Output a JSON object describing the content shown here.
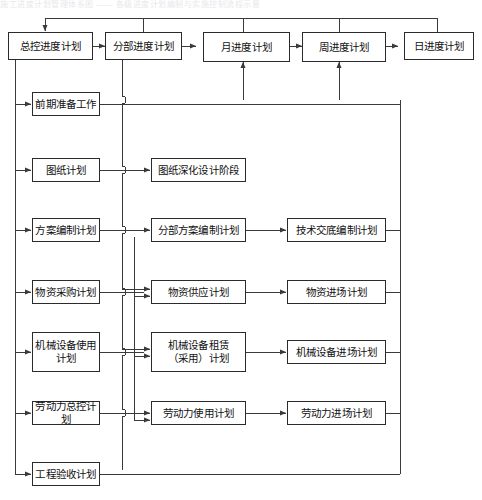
{
  "diagram": {
    "title_strip": "施工进度计划管理体系图 —— 各级进度计划编制与实施控制流程示意",
    "colors": {
      "box_border": "#2b2b2b",
      "line": "#3a3a3a",
      "background": "#ffffff",
      "text": "#111111"
    },
    "nodes": {
      "master_schedule": "总控进度计划",
      "section_schedule": "分部进度计划",
      "month_schedule": "月进度计划",
      "week_schedule": "周进度计划",
      "day_schedule": "日进度计划",
      "prep_work": "前期准备工作",
      "drawing_plan": "图纸计划",
      "scheme_plan": "方案编制计划",
      "material_purchase_plan": "物资采购计划",
      "equipment_use_plan": "机械设备使用\n计划",
      "labor_master_plan": "劳动力总控计划",
      "acceptance_plan": "工程验收计划",
      "drawing_deepening_stage": "图纸深化设计阶段",
      "section_scheme_plan": "分部方案编制计划",
      "material_supply_plan": "物资供应计划",
      "equipment_lease_plan": "机械设备租赁\n（采用）计划",
      "labor_use_plan": "劳动力使用计划",
      "tech_disclosure_plan": "技术交底编制计划",
      "material_arrival_plan": "物资进场计划",
      "equipment_arrival_plan": "机械设备进场计划",
      "labor_arrival_plan": "劳动力进场计划"
    }
  }
}
